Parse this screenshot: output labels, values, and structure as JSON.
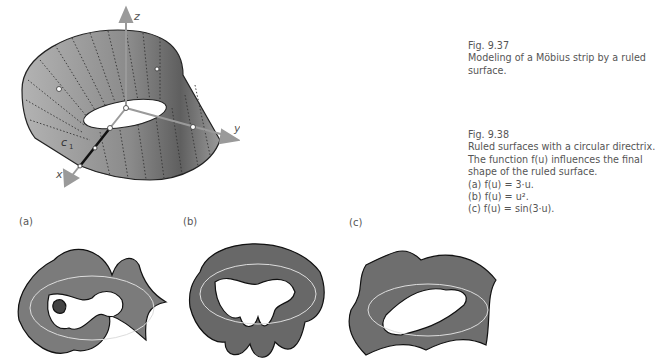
{
  "figures": {
    "fig937": {
      "number": "Fig. 9.37",
      "caption_lines": [
        "Modeling of a Möbius strip by a ruled",
        "surface."
      ],
      "axis_labels": {
        "x": "x",
        "y": "y",
        "z": "z"
      },
      "curve_label": "c",
      "curve_subscript": "1"
    },
    "fig938": {
      "number": "Fig. 9.38",
      "caption_lines": [
        "Ruled surfaces with a circular directrix.",
        "The function f(u) influences the final",
        "shape of the ruled surface."
      ],
      "items": [
        {
          "label": "(a) f(u) = 3·u."
        },
        {
          "label": "(b) f(u) = u²."
        },
        {
          "label": "(c) f(u) = sin(3·u)."
        }
      ],
      "panels": [
        {
          "tag": "(a)"
        },
        {
          "tag": "(b)"
        },
        {
          "tag": "(c)"
        }
      ]
    }
  },
  "colors": {
    "surface_light": "#a9a9a9",
    "surface_dark": "#5e5e5e",
    "axis": "#9a9a9a",
    "text": "#555555"
  }
}
